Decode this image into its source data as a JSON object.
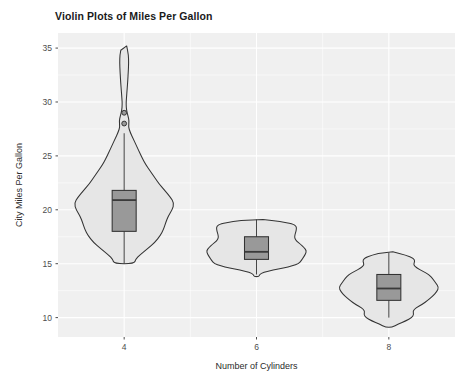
{
  "chart_data": {
    "type": "violin",
    "title": "Violin Plots of Miles Per Gallon",
    "xlabel": "Number of Cylinders",
    "ylabel": "City Miles Per Gallon",
    "grid": true,
    "legend": "none",
    "xlim": [
      3,
      9
    ],
    "ylim": [
      8.2,
      36.4
    ],
    "x_tick_labels": [
      "4",
      "6",
      "8"
    ],
    "x_tick_values": [
      4,
      6,
      8
    ],
    "y_tick_labels": [
      "10",
      "15",
      "20",
      "25",
      "30",
      "35"
    ],
    "y_tick_values": [
      10,
      15,
      20,
      25,
      30,
      35
    ],
    "categories": [
      "4",
      "6",
      "8"
    ],
    "groups": [
      {
        "name": "4",
        "x": 4,
        "violin_min": 15.0,
        "violin_max": 35.2,
        "box": {
          "q1": 18.0,
          "median": 20.9,
          "q3": 21.8,
          "whisker_low": 15.0,
          "whisker_high": 27.1
        },
        "outliers": [
          29.0,
          28.0
        ],
        "density": [
          {
            "v": 35.2,
            "w": 0.05
          },
          {
            "v": 34.4,
            "w": 0.085
          },
          {
            "v": 33.6,
            "w": 0.09
          },
          {
            "v": 32.8,
            "w": 0.082
          },
          {
            "v": 32.0,
            "w": 0.072
          },
          {
            "v": 31.2,
            "w": 0.06
          },
          {
            "v": 30.4,
            "w": 0.046
          },
          {
            "v": 29.8,
            "w": 0.038
          },
          {
            "v": 29.2,
            "w": 0.048
          },
          {
            "v": 28.7,
            "w": 0.078
          },
          {
            "v": 28.2,
            "w": 0.1
          },
          {
            "v": 27.7,
            "w": 0.085
          },
          {
            "v": 27.2,
            "w": 0.12
          },
          {
            "v": 26.6,
            "w": 0.18
          },
          {
            "v": 26.0,
            "w": 0.24
          },
          {
            "v": 25.4,
            "w": 0.3
          },
          {
            "v": 24.8,
            "w": 0.36
          },
          {
            "v": 24.2,
            "w": 0.43
          },
          {
            "v": 23.6,
            "w": 0.52
          },
          {
            "v": 23.0,
            "w": 0.61
          },
          {
            "v": 22.4,
            "w": 0.7
          },
          {
            "v": 21.8,
            "w": 0.81
          },
          {
            "v": 21.2,
            "w": 0.92
          },
          {
            "v": 20.6,
            "w": 1.0
          },
          {
            "v": 20.0,
            "w": 0.96
          },
          {
            "v": 19.4,
            "w": 0.88
          },
          {
            "v": 18.8,
            "w": 0.83
          },
          {
            "v": 18.2,
            "w": 0.79
          },
          {
            "v": 17.6,
            "w": 0.72
          },
          {
            "v": 17.0,
            "w": 0.62
          },
          {
            "v": 16.4,
            "w": 0.47
          },
          {
            "v": 15.8,
            "w": 0.31
          },
          {
            "v": 15.4,
            "w": 0.23
          },
          {
            "v": 15.0,
            "w": 0.2
          }
        ]
      },
      {
        "name": "6",
        "x": 6,
        "violin_min": 13.8,
        "violin_max": 19.1,
        "box": {
          "q1": 15.4,
          "median": 16.1,
          "q3": 17.5,
          "whisker_low": 14.0,
          "whisker_high": 19.1
        },
        "outliers": [],
        "density": [
          {
            "v": 19.1,
            "w": 0.13
          },
          {
            "v": 18.9,
            "w": 0.48
          },
          {
            "v": 18.7,
            "w": 0.72
          },
          {
            "v": 18.5,
            "w": 0.79
          },
          {
            "v": 18.3,
            "w": 0.8
          },
          {
            "v": 18.0,
            "w": 0.79
          },
          {
            "v": 17.7,
            "w": 0.77
          },
          {
            "v": 17.4,
            "w": 0.76
          },
          {
            "v": 17.1,
            "w": 0.8
          },
          {
            "v": 16.8,
            "w": 0.88
          },
          {
            "v": 16.5,
            "w": 0.95
          },
          {
            "v": 16.2,
            "w": 1.0
          },
          {
            "v": 15.9,
            "w": 0.98
          },
          {
            "v": 15.6,
            "w": 0.94
          },
          {
            "v": 15.3,
            "w": 0.9
          },
          {
            "v": 15.0,
            "w": 0.84
          },
          {
            "v": 14.8,
            "w": 0.72
          },
          {
            "v": 14.6,
            "w": 0.54
          },
          {
            "v": 14.4,
            "w": 0.33
          },
          {
            "v": 14.2,
            "w": 0.14
          },
          {
            "v": 14.0,
            "w": 0.06
          },
          {
            "v": 13.8,
            "w": 0.05
          }
        ]
      },
      {
        "name": "8",
        "x": 8,
        "violin_min": 9.1,
        "violin_max": 16.1,
        "box": {
          "q1": 11.6,
          "median": 12.7,
          "q3": 14.0,
          "whisker_low": 10.0,
          "whisker_high": 16.0
        },
        "outliers": [],
        "density": [
          {
            "v": 16.1,
            "w": 0.08
          },
          {
            "v": 15.8,
            "w": 0.34
          },
          {
            "v": 15.5,
            "w": 0.5
          },
          {
            "v": 15.2,
            "w": 0.52
          },
          {
            "v": 14.9,
            "w": 0.49
          },
          {
            "v": 14.6,
            "w": 0.56
          },
          {
            "v": 14.3,
            "w": 0.68
          },
          {
            "v": 14.0,
            "w": 0.8
          },
          {
            "v": 13.6,
            "w": 0.88
          },
          {
            "v": 13.2,
            "w": 0.94
          },
          {
            "v": 12.8,
            "w": 1.0
          },
          {
            "v": 12.4,
            "w": 0.96
          },
          {
            "v": 12.0,
            "w": 0.88
          },
          {
            "v": 11.6,
            "w": 0.78
          },
          {
            "v": 11.2,
            "w": 0.66
          },
          {
            "v": 10.9,
            "w": 0.54
          },
          {
            "v": 10.6,
            "w": 0.48
          },
          {
            "v": 10.3,
            "w": 0.5
          },
          {
            "v": 10.0,
            "w": 0.46
          },
          {
            "v": 9.7,
            "w": 0.34
          },
          {
            "v": 9.4,
            "w": 0.19
          },
          {
            "v": 9.1,
            "w": 0.06
          }
        ]
      }
    ]
  },
  "style": {
    "panel_bg": "#f0f0f0",
    "grid_color": "#ffffff",
    "violin_fill": "#e6e6e6",
    "violin_stroke": "#333333",
    "box_fill": "#999999",
    "box_stroke": "#333333",
    "tick_color": "#4d4d4d",
    "title_color": "#1a1a1a"
  }
}
